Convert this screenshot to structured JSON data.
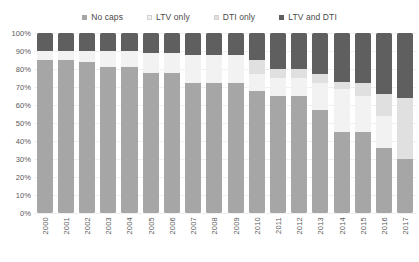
{
  "chart_data": {
    "type": "bar",
    "stacked": true,
    "normalized": true,
    "title": "",
    "subtitle": "",
    "xlabel": "",
    "ylabel": "",
    "ylim": [
      0,
      100
    ],
    "grid": false,
    "legend_position": "top",
    "categories": [
      "2000",
      "2001",
      "2002",
      "2003",
      "2004",
      "2005",
      "2006",
      "2007",
      "2008",
      "2009",
      "2010",
      "2011",
      "2012",
      "2013",
      "2014",
      "2015",
      "2016",
      "2017"
    ],
    "ytick_labels": [
      "100%",
      "90%",
      "80%",
      "70%",
      "60%",
      "50%",
      "40%",
      "30%",
      "20%",
      "10%",
      "0%"
    ],
    "ytick_values": [
      100,
      90,
      80,
      70,
      60,
      50,
      40,
      30,
      20,
      10,
      0
    ],
    "series": [
      {
        "name": "No caps",
        "color": "#a6a6a6",
        "values": [
          85,
          85,
          84,
          81,
          81,
          78,
          78,
          72,
          72,
          72,
          68,
          65,
          65,
          57,
          45,
          45,
          36,
          30
        ]
      },
      {
        "name": "LTV only",
        "color": "#f2f2f2",
        "values": [
          5,
          5,
          6,
          9,
          9,
          11,
          11,
          16,
          16,
          16,
          9,
          10,
          10,
          15,
          24,
          20,
          18,
          0
        ]
      },
      {
        "name": "DTI only",
        "color": "#e0e0e0",
        "values": [
          0,
          0,
          0,
          0,
          0,
          0,
          0,
          0,
          0,
          0,
          8,
          5,
          5,
          5,
          4,
          7,
          12,
          34
        ]
      },
      {
        "name": "LTV and DTI",
        "color": "#5f5f5f",
        "values": [
          10,
          10,
          10,
          10,
          10,
          11,
          11,
          12,
          12,
          12,
          15,
          20,
          20,
          23,
          27,
          28,
          34,
          36
        ]
      }
    ]
  },
  "legend": {
    "items": [
      {
        "label": "No caps",
        "color": "#a6a6a6"
      },
      {
        "label": "LTV only",
        "color": "#f2f2f2"
      },
      {
        "label": "DTI only",
        "color": "#e0e0e0"
      },
      {
        "label": "LTV and DTI",
        "color": "#5f5f5f"
      }
    ]
  }
}
